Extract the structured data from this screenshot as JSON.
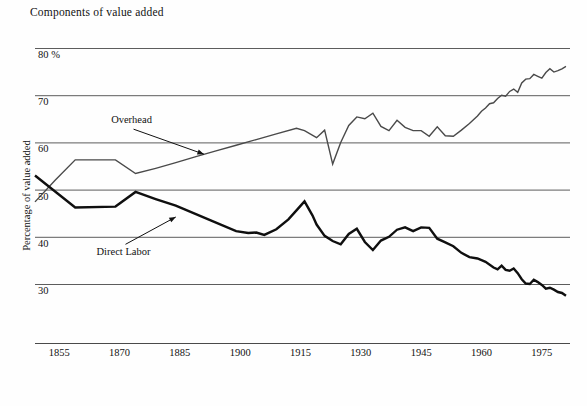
{
  "chart_data": {
    "type": "line",
    "title": "Components of value added",
    "xlabel": "",
    "ylabel": "Percentage of value added",
    "xlim": [
      1849,
      1983
    ],
    "ylim": [
      20,
      82
    ],
    "grid": true,
    "gridlines_y": [
      80,
      70,
      60,
      50,
      40,
      30
    ],
    "legend_position": "inline-annotations",
    "ytick_labels": [
      "80 %",
      "70",
      "60",
      "50",
      "40",
      "30"
    ],
    "ytick_values": [
      80,
      70,
      60,
      50,
      40,
      30
    ],
    "xtick_labels": [
      "1855",
      "1870",
      "1885",
      "1900",
      "1915",
      "1930",
      "1945",
      "1960",
      "1975"
    ],
    "xtick_values": [
      1855,
      1870,
      1885,
      1900,
      1915,
      1930,
      1945,
      1960,
      1975
    ],
    "annotations": [
      {
        "text": "Overhead",
        "x": 1873,
        "y": 64.5,
        "points_to_x": 1891,
        "points_to_y": 57.5
      },
      {
        "text": "Direct Labor",
        "x": 1871,
        "y": 36.5,
        "points_to_x": 1884,
        "points_to_y": 44.2
      }
    ],
    "series": [
      {
        "name": "Overhead",
        "color": "#4a4a4a",
        "width": 1.4,
        "x": [
          1849,
          1854,
          1859,
          1869,
          1874,
          1879,
          1884,
          1889,
          1894,
          1899,
          1904,
          1909,
          1914,
          1916,
          1919,
          1921,
          1923,
          1925,
          1927,
          1929,
          1931,
          1933,
          1935,
          1937,
          1939,
          1941,
          1943,
          1945,
          1947,
          1949,
          1951,
          1953,
          1955,
          1957,
          1958,
          1959,
          1960,
          1961,
          1962,
          1963,
          1964,
          1965,
          1966,
          1967,
          1968,
          1969,
          1970,
          1971,
          1972,
          1973,
          1974,
          1975,
          1976,
          1977,
          1978,
          1979,
          1980,
          1981
        ],
        "y": [
          47.4,
          52.0,
          56.3,
          56.3,
          53.4,
          54.5,
          55.7,
          57.0,
          58.2,
          59.4,
          60.6,
          61.8,
          63.0,
          62.5,
          61.0,
          62.6,
          55.4,
          60.0,
          63.6,
          65.4,
          65.0,
          66.2,
          63.4,
          62.5,
          64.7,
          63.2,
          62.5,
          62.5,
          61.3,
          63.3,
          61.4,
          61.3,
          62.6,
          64.0,
          64.8,
          65.6,
          66.6,
          67.3,
          68.2,
          68.4,
          69.3,
          70.0,
          69.8,
          70.8,
          71.3,
          70.6,
          72.6,
          73.4,
          73.5,
          74.4,
          74.0,
          73.6,
          74.8,
          75.6,
          74.9,
          75.2,
          75.6,
          76.1
        ]
      },
      {
        "name": "Direct Labor",
        "color": "#0f0f0f",
        "width": 2.4,
        "x": [
          1849,
          1854,
          1859,
          1869,
          1874,
          1879,
          1884,
          1889,
          1894,
          1899,
          1902,
          1904,
          1906,
          1909,
          1912,
          1914,
          1916,
          1918,
          1919,
          1921,
          1923,
          1925,
          1927,
          1929,
          1931,
          1933,
          1935,
          1937,
          1939,
          1941,
          1943,
          1945,
          1947,
          1949,
          1951,
          1953,
          1955,
          1957,
          1959,
          1961,
          1963,
          1964,
          1965,
          1966,
          1967,
          1968,
          1969,
          1970,
          1971,
          1972,
          1973,
          1974,
          1975,
          1976,
          1977,
          1978,
          1979,
          1980,
          1981
        ],
        "y": [
          53.0,
          49.6,
          46.2,
          46.4,
          49.5,
          48.0,
          46.6,
          44.8,
          43.0,
          41.2,
          40.8,
          40.9,
          40.4,
          41.6,
          43.7,
          45.6,
          47.5,
          44.5,
          42.6,
          40.2,
          39.1,
          38.4,
          40.6,
          41.7,
          38.9,
          37.2,
          39.2,
          40.0,
          41.5,
          42.0,
          41.2,
          42.0,
          41.9,
          39.6,
          38.8,
          38.0,
          36.6,
          35.7,
          35.4,
          34.7,
          33.5,
          33.1,
          33.9,
          33.0,
          32.8,
          33.3,
          32.3,
          31.0,
          30.1,
          30.0,
          30.9,
          30.4,
          29.8,
          29.0,
          29.2,
          28.8,
          28.3,
          28.1,
          27.5
        ]
      }
    ]
  }
}
